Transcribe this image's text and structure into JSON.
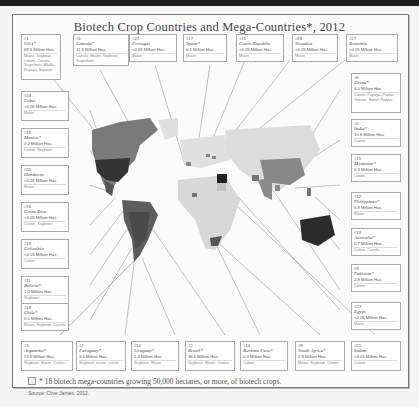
{
  "title": "Biotech Crop Countries and Mega-Countries*, 2012",
  "footnote": "* 18 biotech mega-countries growing 50,000 hectares, or more, of biotech crops.",
  "source": "Source: Clive James, 2012.",
  "colors": {
    "mega": "#555555",
    "minor": "#bcbcbc",
    "dark": "#2a2a2a",
    "land": "#e2e2e2"
  },
  "countries": [
    {
      "rank": "#1",
      "name": "USA*",
      "area": "69.5 Million Has.",
      "crops": "Maize, Soybean, Cotton, Canola, Sugarbeet, Alfalfa, Papaya, Squash"
    },
    {
      "rank": "#4",
      "name": "Canada*",
      "area": "11.6 Million Has.",
      "crops": "Canola, Maize, Soybean, Sugarbeet"
    },
    {
      "rank": "#22",
      "name": "Portugal",
      "area": "<0.05 Million Has.",
      "crops": "Maize"
    },
    {
      "rank": "#17",
      "name": "Spain*",
      "area": "0.1 Million Has.",
      "crops": "Maize"
    },
    {
      "rank": "#25",
      "name": "Czech Republic",
      "area": "<0.05 Million Has.",
      "crops": "Maize"
    },
    {
      "rank": "#28",
      "name": "Slovakia",
      "area": "<0.05 Million Has.",
      "crops": "Maize"
    },
    {
      "rank": "#27",
      "name": "Romania",
      "area": "<0.05 Million Has.",
      "crops": "Maize"
    },
    {
      "rank": "#24",
      "name": "Cuba",
      "area": "<0.05 Million Has.",
      "crops": "Maize"
    },
    {
      "rank": "#16",
      "name": "Mexico*",
      "area": "0.2 Million Has.",
      "crops": "Cotton, Soybean"
    },
    {
      "rank": "#20",
      "name": "Honduras",
      "area": "<0.05 Million Has.",
      "crops": "Maize"
    },
    {
      "rank": "#26",
      "name": "Costa Rica",
      "area": "<0.05 Million Has.",
      "crops": "Cotton, Soybean"
    },
    {
      "rank": "#19",
      "name": "Colombia",
      "area": "<0.05 Million Has.",
      "crops": "Cotton"
    },
    {
      "rank": "#11",
      "name": "Bolivia*",
      "area": "1.0 Million Has.",
      "crops": "Soybean"
    },
    {
      "rank": "#18",
      "name": "Chile*",
      "area": "0.1 Million Has.",
      "crops": "Maize, Soybean, Canola"
    },
    {
      "rank": "#3",
      "name": "Argentina*",
      "area": "23.9 Million Has.",
      "crops": "Soybean, Maize, Cotton"
    },
    {
      "rank": "#7",
      "name": "Paraguay*",
      "area": "3.4 Million Has.",
      "crops": "Soybean, maize, cotton"
    },
    {
      "rank": "#10",
      "name": "Uruguay*",
      "area": "1.4 Million Has.",
      "crops": "Soybean, Maize"
    },
    {
      "rank": "#2",
      "name": "Brazil*",
      "area": "36.6 Million Has.",
      "crops": "Soybean, Maize, Cotton"
    },
    {
      "rank": "#14",
      "name": "Burkina Faso*",
      "area": "0.3 Million Has.",
      "crops": "Cotton"
    },
    {
      "rank": "#8",
      "name": "South Africa*",
      "area": "2.9 Million Has.",
      "crops": "Maize, Soybean, Cotton"
    },
    {
      "rank": "#21",
      "name": "Sudan",
      "area": "<0.05 Million Has.",
      "crops": "Cotton"
    },
    {
      "rank": "#6",
      "name": "China*",
      "area": "4.0 Million Has.",
      "crops": "Cotton, Papaya, Poplar, Tomato, Sweet Pepper"
    },
    {
      "rank": "#5",
      "name": "India*",
      "area": "10.8 Million Has.",
      "crops": "Cotton"
    },
    {
      "rank": "#15",
      "name": "Myanmar*",
      "area": "0.3 Million Has.",
      "crops": "Cotton"
    },
    {
      "rank": "#12",
      "name": "Philippines*",
      "area": "0.8 Million Has.",
      "crops": "Maize"
    },
    {
      "rank": "#13",
      "name": "Australia*",
      "area": "0.7 Million Has.",
      "crops": "Cotton, Canola"
    },
    {
      "rank": "#9",
      "name": "Pakistan*",
      "area": "2.8 Million Has.",
      "crops": "Cotton"
    },
    {
      "rank": "#23",
      "name": "Egypt",
      "area": "<0.05 Million Has.",
      "crops": "Maize"
    }
  ]
}
